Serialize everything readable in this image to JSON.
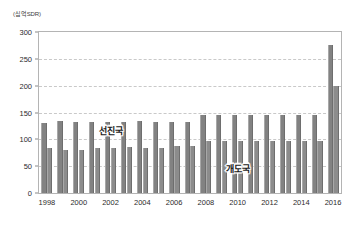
{
  "chart_data": {
    "type": "bar",
    "title": "",
    "xlabel": "",
    "ylabel": "",
    "unit_label": "(십억SDR)",
    "ylim": [
      0,
      300
    ],
    "yticks": [
      0,
      50,
      100,
      150,
      200,
      250,
      300
    ],
    "ytick_labels": [
      "0",
      "50",
      "100",
      "150",
      "200",
      "250",
      "300"
    ],
    "grid": true,
    "grid_axis": "y",
    "legend": "inline-annotation",
    "categories": [
      "1998",
      "1999",
      "2000",
      "2001",
      "2002",
      "2003",
      "2004",
      "2005",
      "2006",
      "2007",
      "2008",
      "2009",
      "2010",
      "2011",
      "2012",
      "2013",
      "2014",
      "2015",
      "2016"
    ],
    "xtick_labels": [
      "1998",
      "",
      "2000",
      "",
      "2002",
      "",
      "2004",
      "",
      "2006",
      "",
      "2008",
      "",
      "2010",
      "",
      "2012",
      "",
      "2014",
      "",
      "2016"
    ],
    "series": [
      {
        "name": "선진국",
        "color": "#828282",
        "values": [
          131,
          134,
          133,
          133,
          133,
          133,
          134,
          133,
          133,
          133,
          146,
          146,
          146,
          146,
          146,
          146,
          146,
          146,
          275
        ]
      },
      {
        "name": "개도국",
        "color": "#8c8c8c",
        "values": [
          84,
          81,
          81,
          83,
          84,
          85,
          83,
          84,
          87,
          87,
          97,
          97,
          97,
          97,
          97,
          97,
          97,
          97,
          200
        ]
      }
    ],
    "annotations": [
      {
        "text": "선진국",
        "x_category": "2002",
        "y_value": 118
      },
      {
        "text": "개도국",
        "x_category": "2010",
        "y_value": 47
      }
    ]
  },
  "style": {
    "plot_border_color": "#b4b4b4",
    "gridline_color": "#c9c9c9",
    "background": "#ffffff",
    "axis_text_color": "#2b2b2b"
  }
}
